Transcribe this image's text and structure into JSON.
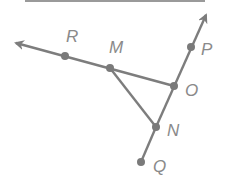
{
  "diagram": {
    "colors": {
      "line": "#7d7d7d",
      "point": "#7a7a7a",
      "label": "#8a8a8a",
      "top_rule": "#9a9a9a"
    },
    "top_rule": {
      "x1": 25,
      "y1": 1,
      "x2": 205,
      "y2": 1
    },
    "points": [
      {
        "id": "R",
        "label": "R",
        "x": 65,
        "y": 56,
        "lx": 66,
        "ly": 42
      },
      {
        "id": "M",
        "label": "M",
        "x": 110,
        "y": 68,
        "lx": 109,
        "ly": 53
      },
      {
        "id": "O",
        "label": "O",
        "x": 174,
        "y": 86,
        "lx": 185,
        "ly": 96
      },
      {
        "id": "P",
        "label": "P",
        "x": 191,
        "y": 47,
        "lx": 201,
        "ly": 55
      },
      {
        "id": "N",
        "label": "N",
        "x": 156,
        "y": 127,
        "lx": 167,
        "ly": 136
      },
      {
        "id": "Q",
        "label": "Q",
        "x": 141,
        "y": 162,
        "lx": 153,
        "ly": 172
      }
    ],
    "rays": [
      {
        "name": "ray-OR",
        "from": "O",
        "through": "R",
        "arrow_tip": {
          "x": 16,
          "y": 43
        }
      },
      {
        "name": "ray-NP",
        "from": "N",
        "through": "P",
        "arrow_tip": {
          "x": 206,
          "y": 15
        }
      }
    ],
    "segments": [
      {
        "name": "segment-MN",
        "from": "M",
        "to": "N"
      },
      {
        "name": "segment-NQ",
        "from": "N",
        "to": "Q"
      }
    ]
  }
}
